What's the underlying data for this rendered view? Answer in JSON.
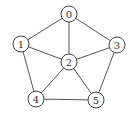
{
  "graph": {
    "nodes": [
      {
        "id": "0",
        "label": "0",
        "x": 69,
        "y": 14
      },
      {
        "id": "1",
        "label": "1",
        "x": 21,
        "y": 44
      },
      {
        "id": "2",
        "label": "2",
        "x": 69,
        "y": 62
      },
      {
        "id": "3",
        "label": "3",
        "x": 117,
        "y": 45
      },
      {
        "id": "4",
        "label": "4",
        "x": 36,
        "y": 99
      },
      {
        "id": "5",
        "label": "5",
        "x": 96,
        "y": 100
      }
    ],
    "edges": [
      [
        "0",
        "1"
      ],
      [
        "0",
        "2"
      ],
      [
        "0",
        "3"
      ],
      [
        "1",
        "2"
      ],
      [
        "1",
        "4"
      ],
      [
        "2",
        "3"
      ],
      [
        "2",
        "4"
      ],
      [
        "2",
        "5"
      ],
      [
        "3",
        "5"
      ],
      [
        "4",
        "5"
      ]
    ],
    "node_radius": 8,
    "colors": {
      "stroke": "#444444",
      "edge": "#555555",
      "fill": "#ffffff",
      "text": "#333333"
    }
  }
}
